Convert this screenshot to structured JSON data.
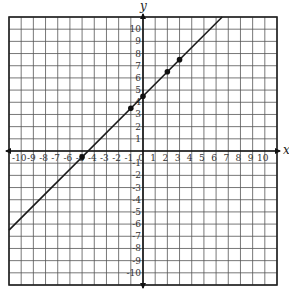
{
  "chart_data": {
    "type": "line",
    "title": "",
    "xlabel": "x",
    "ylabel": "y",
    "xlim": [
      -11,
      11
    ],
    "ylim": [
      -11,
      11
    ],
    "grid": true,
    "x_ticks": [
      -10,
      -9,
      -8,
      -7,
      -6,
      -5,
      -4,
      -3,
      -2,
      -1,
      0,
      1,
      2,
      3,
      4,
      5,
      6,
      7,
      8,
      9,
      10
    ],
    "y_ticks": [
      10,
      9,
      8,
      7,
      6,
      5,
      4,
      3,
      2,
      1,
      -1,
      -2,
      -3,
      -4,
      -5,
      -6,
      -7,
      -8,
      -9,
      -10
    ],
    "line": {
      "slope": 1,
      "intercept": 4.5,
      "equation": "y = x + 4.5"
    },
    "points": [
      {
        "x": -5,
        "y": -0.5
      },
      {
        "x": -1,
        "y": 3.5
      },
      {
        "x": 0,
        "y": 4.5
      },
      {
        "x": 2,
        "y": 6.5
      },
      {
        "x": 3,
        "y": 7.5
      }
    ],
    "colors": {
      "grid": "#555555",
      "axis": "#111111",
      "line": "#1a1a1a",
      "point": "#111111"
    }
  }
}
